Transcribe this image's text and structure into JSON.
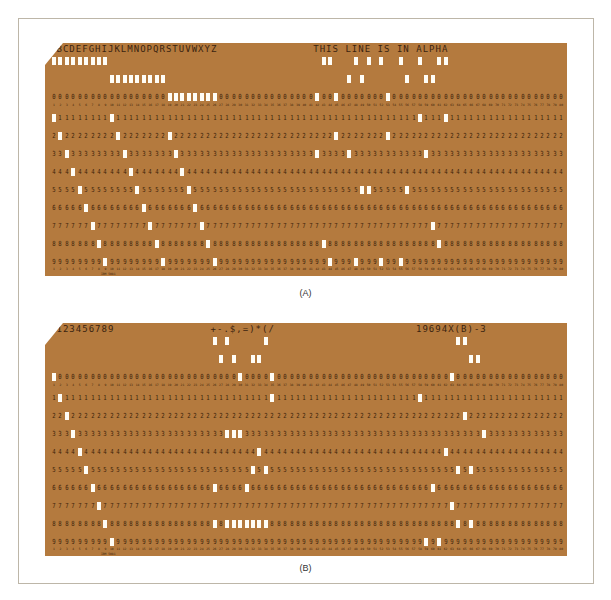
{
  "figure": {
    "cards": [
      {
        "id": "A",
        "caption": "(A)",
        "print_segments": [
          {
            "start_col": 1,
            "text": "ABCDEFGHIJKLMNOPQRSTUVWXYZ"
          },
          {
            "start_col": 42,
            "text": "THIS LINE IS IN ALPHA"
          }
        ],
        "footer_mark": "IBM 5081"
      },
      {
        "id": "B",
        "caption": "(B)",
        "print_segments": [
          {
            "start_col": 1,
            "text": "0123456789"
          },
          {
            "start_col": 26,
            "text": "+-.$,=)*(/"
          },
          {
            "start_col": 58,
            "text": "19694X(B)-3"
          }
        ],
        "footer_mark": "IBM 5081"
      }
    ],
    "card_format": {
      "columns": 80,
      "printed_digit_rows": [
        "0",
        "1",
        "2",
        "3",
        "4",
        "5",
        "6",
        "7",
        "8",
        "9"
      ],
      "punch_rows": [
        "12",
        "11",
        "0",
        "1",
        "2",
        "3",
        "4",
        "5",
        "6",
        "7",
        "8",
        "9"
      ]
    },
    "colors": {
      "card": "#b47a3e",
      "ink": "#3b1f0a",
      "hole": "#fffdf6",
      "frame_border": "#bdb6a8"
    },
    "hollerith": {
      "A": [
        "12",
        "1"
      ],
      "B": [
        "12",
        "2"
      ],
      "C": [
        "12",
        "3"
      ],
      "D": [
        "12",
        "4"
      ],
      "E": [
        "12",
        "5"
      ],
      "F": [
        "12",
        "6"
      ],
      "G": [
        "12",
        "7"
      ],
      "H": [
        "12",
        "8"
      ],
      "I": [
        "12",
        "9"
      ],
      "J": [
        "11",
        "1"
      ],
      "K": [
        "11",
        "2"
      ],
      "L": [
        "11",
        "3"
      ],
      "M": [
        "11",
        "4"
      ],
      "N": [
        "11",
        "5"
      ],
      "O": [
        "11",
        "6"
      ],
      "P": [
        "11",
        "7"
      ],
      "Q": [
        "11",
        "8"
      ],
      "R": [
        "11",
        "9"
      ],
      "S": [
        "0",
        "2"
      ],
      "T": [
        "0",
        "3"
      ],
      "U": [
        "0",
        "4"
      ],
      "V": [
        "0",
        "5"
      ],
      "W": [
        "0",
        "6"
      ],
      "X": [
        "0",
        "7"
      ],
      "Y": [
        "0",
        "8"
      ],
      "Z": [
        "0",
        "9"
      ],
      "0": [
        "0"
      ],
      "1": [
        "1"
      ],
      "2": [
        "2"
      ],
      "3": [
        "3"
      ],
      "4": [
        "4"
      ],
      "5": [
        "5"
      ],
      "6": [
        "6"
      ],
      "7": [
        "7"
      ],
      "8": [
        "8"
      ],
      "9": [
        "9"
      ],
      "+": [
        "12",
        "6",
        "8"
      ],
      "-": [
        "11"
      ],
      ".": [
        "12",
        "3",
        "8"
      ],
      "$": [
        "11",
        "3",
        "8"
      ],
      ",": [
        "0",
        "3",
        "8"
      ],
      "=": [
        "6",
        "8"
      ],
      ")": [
        "11",
        "5",
        "8"
      ],
      "*": [
        "11",
        "4",
        "8"
      ],
      "(": [
        "12",
        "5",
        "8"
      ],
      "/": [
        "0",
        "1"
      ],
      " ": []
    }
  }
}
